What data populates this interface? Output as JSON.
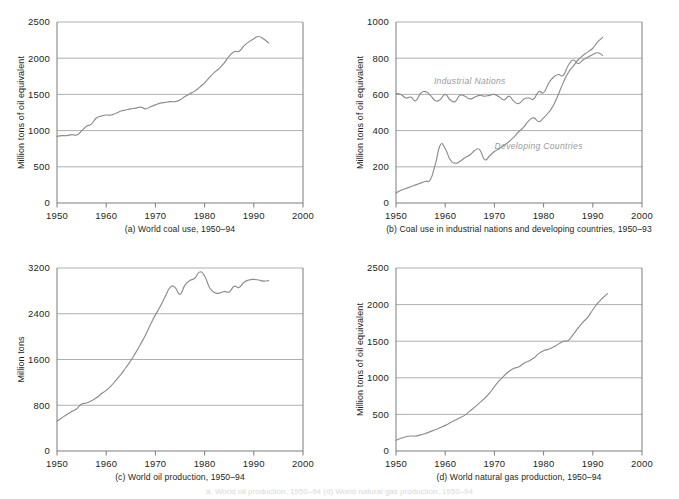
{
  "figure": {
    "background": "#ffffff",
    "line_color": "#8c8c8c",
    "grid_color": "#9b9b9b",
    "label_color": "#9a9a9a",
    "footnote": "a. World oil production, 1950–94 (d) World natural gas production, 1950–94"
  },
  "chart_data": [
    {
      "id": "a",
      "type": "line",
      "title": "",
      "caption": "(a) World coal use, 1950–94",
      "xlabel": "",
      "ylabel": "Million tons of oil equivalent",
      "xlim": [
        1950,
        2000
      ],
      "ylim": [
        0,
        2500
      ],
      "xticks": [
        "1950",
        "1960",
        "1970",
        "1980",
        "1990",
        "2000"
      ],
      "xtick_values": [
        1950,
        1960,
        1970,
        1980,
        1990,
        2000
      ],
      "yticks": [
        "0",
        "500",
        "1000",
        "1500",
        "2000",
        "2500"
      ],
      "ytick_values": [
        0,
        500,
        1000,
        1500,
        2000,
        2500
      ],
      "grid": "horizontal",
      "legend": "none",
      "series": [
        {
          "name": "World coal use",
          "x": [
            1950,
            1951,
            1952,
            1953,
            1954,
            1955,
            1956,
            1957,
            1958,
            1959,
            1960,
            1961,
            1962,
            1963,
            1964,
            1965,
            1966,
            1967,
            1968,
            1969,
            1970,
            1971,
            1972,
            1973,
            1974,
            1975,
            1976,
            1977,
            1978,
            1979,
            1980,
            1981,
            1982,
            1983,
            1984,
            1985,
            1986,
            1987,
            1988,
            1989,
            1990,
            1991,
            1992,
            1993
          ],
          "values": [
            920,
            930,
            930,
            945,
            940,
            995,
            1060,
            1090,
            1175,
            1200,
            1215,
            1215,
            1240,
            1270,
            1285,
            1300,
            1310,
            1325,
            1300,
            1330,
            1355,
            1380,
            1390,
            1400,
            1400,
            1425,
            1470,
            1510,
            1545,
            1600,
            1660,
            1735,
            1805,
            1860,
            1935,
            2030,
            2090,
            2095,
            2170,
            2225,
            2270,
            2300,
            2265,
            2210,
            2215
          ]
        }
      ]
    },
    {
      "id": "b",
      "type": "line",
      "title": "",
      "caption": "(b) Coal use in industrial nations and developing countries, 1950–93",
      "xlabel": "",
      "ylabel": "Million tons of oil equivalent",
      "xlim": [
        1950,
        2000
      ],
      "ylim": [
        0,
        1000
      ],
      "xticks": [
        "1950",
        "1960",
        "1970",
        "1980",
        "1990",
        "2000"
      ],
      "xtick_values": [
        1950,
        1960,
        1970,
        1980,
        1990,
        2000
      ],
      "yticks": [
        "0",
        "200",
        "400",
        "600",
        "800",
        "1000"
      ],
      "ytick_values": [
        0,
        200,
        400,
        600,
        800,
        1000
      ],
      "grid": "horizontal",
      "legend": "inline-annotations",
      "annotations": [
        {
          "text": "Industrial Nations",
          "x": 1965,
          "y": 660
        },
        {
          "text": "Developing Countries",
          "x": 1979,
          "y": 300
        }
      ],
      "series": [
        {
          "name": "Industrial Nations",
          "x": [
            1950,
            1951,
            1952,
            1953,
            1954,
            1955,
            1956,
            1957,
            1958,
            1959,
            1960,
            1961,
            1962,
            1963,
            1964,
            1965,
            1966,
            1967,
            1968,
            1969,
            1970,
            1971,
            1972,
            1973,
            1974,
            1975,
            1976,
            1977,
            1978,
            1979,
            1980,
            1981,
            1982,
            1983,
            1984,
            1985,
            1986,
            1987,
            1988,
            1989,
            1990,
            1991,
            1992
          ],
          "values": [
            605,
            600,
            580,
            585,
            565,
            605,
            615,
            595,
            565,
            572,
            600,
            570,
            560,
            595,
            590,
            575,
            585,
            595,
            590,
            595,
            600,
            585,
            570,
            590,
            560,
            550,
            575,
            580,
            575,
            615,
            610,
            660,
            695,
            710,
            705,
            760,
            790,
            770,
            790,
            805,
            820,
            830,
            815
          ]
        },
        {
          "name": "Developing Countries",
          "x": [
            1950,
            1951,
            1952,
            1953,
            1954,
            1955,
            1956,
            1957,
            1958,
            1959,
            1960,
            1961,
            1962,
            1963,
            1964,
            1965,
            1966,
            1967,
            1968,
            1969,
            1970,
            1971,
            1972,
            1973,
            1974,
            1975,
            1976,
            1977,
            1978,
            1979,
            1980,
            1981,
            1982,
            1983,
            1984,
            1985,
            1986,
            1987,
            1988,
            1989,
            1990,
            1991,
            1992
          ],
          "values": [
            55,
            70,
            80,
            90,
            100,
            110,
            120,
            130,
            215,
            320,
            300,
            240,
            220,
            230,
            250,
            265,
            290,
            295,
            240,
            260,
            285,
            300,
            320,
            340,
            365,
            395,
            420,
            455,
            470,
            450,
            470,
            500,
            540,
            600,
            665,
            720,
            755,
            790,
            815,
            835,
            855,
            890,
            915
          ]
        }
      ]
    },
    {
      "id": "c",
      "type": "line",
      "title": "",
      "caption": "(c) World oil production, 1950–94",
      "xlabel": "",
      "ylabel": "Million tons",
      "xlim": [
        1950,
        2000
      ],
      "ylim": [
        0,
        3200
      ],
      "xticks": [
        "1950",
        "1960",
        "1970",
        "1980",
        "1990",
        "2000"
      ],
      "xtick_values": [
        1950,
        1960,
        1970,
        1980,
        1990,
        2000
      ],
      "yticks": [
        "0",
        "800",
        "1600",
        "2400",
        "3200"
      ],
      "ytick_values": [
        0,
        800,
        1600,
        2400,
        3200
      ],
      "grid": "horizontal",
      "legend": "none",
      "series": [
        {
          "name": "World oil production",
          "x": [
            1950,
            1951,
            1952,
            1953,
            1954,
            1955,
            1956,
            1957,
            1958,
            1959,
            1960,
            1961,
            1962,
            1963,
            1964,
            1965,
            1966,
            1967,
            1968,
            1969,
            1970,
            1971,
            1972,
            1973,
            1974,
            1975,
            1976,
            1977,
            1978,
            1979,
            1980,
            1981,
            1982,
            1983,
            1984,
            1985,
            1986,
            1987,
            1988,
            1989,
            1990,
            1991,
            1992,
            1993
          ],
          "values": [
            520,
            580,
            640,
            690,
            740,
            820,
            840,
            880,
            930,
            1000,
            1060,
            1140,
            1240,
            1340,
            1460,
            1580,
            1720,
            1870,
            2030,
            2210,
            2380,
            2530,
            2700,
            2860,
            2860,
            2740,
            2900,
            2980,
            3020,
            3130,
            3060,
            2860,
            2770,
            2760,
            2790,
            2780,
            2880,
            2860,
            2950,
            2990,
            3000,
            2990,
            2970,
            2980
          ]
        }
      ]
    },
    {
      "id": "d",
      "type": "line",
      "title": "",
      "caption": "(d) World natural gas production, 1950–94",
      "xlabel": "",
      "ylabel": "Million tons of oil equivalent",
      "xlim": [
        1950,
        2000
      ],
      "ylim": [
        0,
        2500
      ],
      "xticks": [
        "1950",
        "1960",
        "1970",
        "1980",
        "1990",
        "2000"
      ],
      "xtick_values": [
        1950,
        1960,
        1970,
        1980,
        1990,
        2000
      ],
      "yticks": [
        "0",
        "500",
        "1000",
        "1500",
        "2000",
        "2500"
      ],
      "ytick_values": [
        0,
        500,
        1000,
        1500,
        2000,
        2500
      ],
      "grid": "horizontal",
      "legend": "none",
      "series": [
        {
          "name": "World natural gas production",
          "x": [
            1950,
            1951,
            1952,
            1953,
            1954,
            1955,
            1956,
            1957,
            1958,
            1959,
            1960,
            1961,
            1962,
            1963,
            1964,
            1965,
            1966,
            1967,
            1968,
            1969,
            1970,
            1971,
            1972,
            1973,
            1974,
            1975,
            1976,
            1977,
            1978,
            1979,
            1980,
            1981,
            1982,
            1983,
            1984,
            1985,
            1986,
            1987,
            1988,
            1989,
            1990,
            1991,
            1992,
            1993
          ],
          "values": [
            145,
            175,
            195,
            205,
            205,
            220,
            240,
            265,
            290,
            320,
            350,
            385,
            420,
            455,
            490,
            545,
            600,
            660,
            720,
            790,
            880,
            960,
            1030,
            1090,
            1130,
            1150,
            1200,
            1230,
            1270,
            1330,
            1370,
            1390,
            1420,
            1460,
            1500,
            1510,
            1590,
            1680,
            1760,
            1830,
            1930,
            2020,
            2090,
            2150,
            2170
          ]
        }
      ]
    }
  ]
}
